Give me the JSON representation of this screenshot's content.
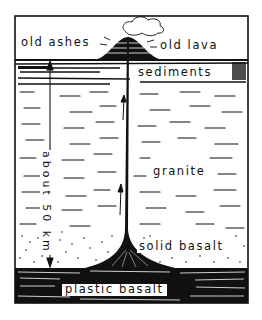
{
  "figure": {
    "type": "cross-section diagram",
    "style": "black ink line drawing on white",
    "colors": {
      "ink": "#111111",
      "paper": "#ffffff"
    }
  },
  "labels": {
    "old_ashes": "old ashes",
    "old_lava": "old lava",
    "sediments": "sediments",
    "granite": "granite",
    "solid_basalt": "solid basalt",
    "plastic_basalt": "plastic basalt",
    "depth": "about 50 km"
  },
  "layers": [
    {
      "name": "surface / air",
      "label_key": "old_ashes"
    },
    {
      "name": "sediments"
    },
    {
      "name": "granite"
    },
    {
      "name": "solid basalt"
    },
    {
      "name": "plastic basalt"
    }
  ],
  "features": {
    "volcano_cone": "layered cone of old ashes and old lava at the surface",
    "cloud": "ash cloud above vent",
    "vent": "central feeder conduit rising from plastic basalt",
    "flow_arrows": 2,
    "depth_arrow": "double-headed arrow spanning sediments to plastic basalt"
  }
}
